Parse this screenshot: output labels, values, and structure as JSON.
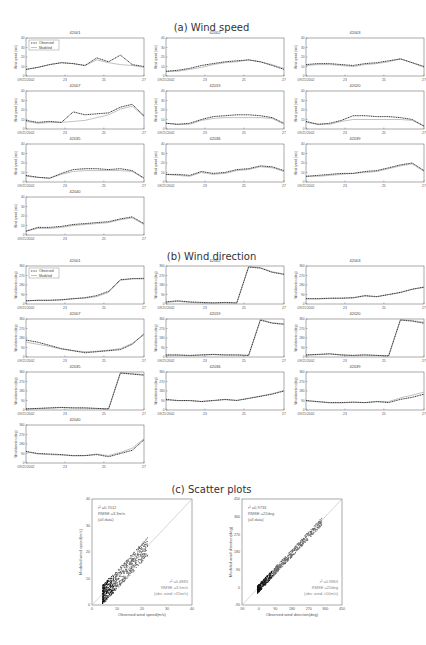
{
  "sections": {
    "a": "(a) Wind speed",
    "b": "(b) Wind direction",
    "c": "(c) Scatter plots"
  },
  "legend": {
    "observed": "Observed",
    "modeled": "Modeled"
  },
  "speed_panels": {
    "ylabel": "Wind speed (m/s)",
    "yticks": [
      "0",
      "10",
      "20",
      "30",
      "40"
    ],
    "xticks": [
      "09/21/2002",
      "23",
      "25",
      "27"
    ],
    "stations": [
      "42001",
      "42002",
      "42003",
      "42007",
      "42019",
      "42020",
      "42035",
      "42036",
      "42039",
      "42040"
    ]
  },
  "direction_panels": {
    "ylabel": "Wind direction (deg)",
    "yticks": [
      "0",
      "90",
      "180",
      "270",
      "360"
    ],
    "xticks": [
      "09/21/2002",
      "23",
      "25",
      "27"
    ],
    "stations": [
      "42001",
      "42002",
      "42003",
      "42007",
      "42019",
      "42020",
      "42035",
      "42036",
      "42039",
      "42040"
    ]
  },
  "scatter_speed": {
    "xlabel": "Observed wind speed(m/s)",
    "ylabel": "Modeled wind speed(m/s)",
    "xticks": [
      "0",
      "10",
      "20",
      "30",
      "40"
    ],
    "yticks": [
      "0",
      "10",
      "20",
      "30",
      "40"
    ],
    "ann1": [
      "r² =0.7012",
      "RMSE =3.3m/s",
      "(all data)"
    ],
    "ann2": [
      "r² =0.4883",
      "RMSE =3.5m/s",
      "(obs. wind >15m/s)"
    ]
  },
  "scatter_dir": {
    "xlabel": "Observed wind direction(deg)",
    "ylabel": "Modeled wind direction(deg)",
    "xticks": [
      "-90",
      "0",
      "90",
      "180",
      "270",
      "360",
      "450"
    ],
    "yticks": [
      "-90",
      "0",
      "90",
      "180",
      "270",
      "360",
      "450"
    ],
    "ann1": [
      "r² =0.9733",
      "RMSE =22deg",
      "(all data)"
    ],
    "ann2": [
      "r² =0.9863",
      "RMSE =22deg",
      "(obs. wind >10m/s)"
    ]
  },
  "chart_data": [
    {
      "type": "line",
      "title": "(a) Wind speed",
      "xlabel": "",
      "ylabel": "Wind speed (m/s)",
      "ylim": [
        0,
        40
      ],
      "x": [
        "09/21/2002",
        "23",
        "25",
        "27"
      ],
      "series_names": [
        "Observed",
        "Modeled"
      ],
      "panels": [
        {
          "station": "42001",
          "observed": [
            7,
            9,
            12,
            14,
            13,
            11,
            19,
            15,
            22,
            12,
            10
          ],
          "modeled": [
            7,
            9,
            12,
            14,
            13,
            11,
            17,
            14,
            12,
            11,
            9
          ]
        },
        {
          "station": "42002",
          "observed": [
            5,
            6,
            8,
            11,
            13,
            15,
            16,
            17,
            15,
            11,
            7
          ],
          "modeled": [
            5,
            5,
            7,
            9,
            12,
            14,
            15,
            17,
            15,
            12,
            8
          ]
        },
        {
          "station": "42003",
          "observed": [
            12,
            13,
            13,
            12,
            11,
            13,
            14,
            16,
            18,
            14,
            10
          ],
          "modeled": [
            11,
            12,
            12,
            11,
            10,
            12,
            13,
            15,
            18,
            14,
            9
          ]
        },
        {
          "station": "42007",
          "observed": [
            9,
            7,
            8,
            7,
            18,
            15,
            16,
            17,
            23,
            26,
            14
          ],
          "modeled": [
            8,
            6,
            7,
            7,
            8,
            9,
            12,
            15,
            21,
            24,
            13
          ]
        },
        {
          "station": "42019",
          "observed": [
            6,
            5,
            6,
            10,
            13,
            14,
            15,
            15,
            14,
            12,
            6
          ],
          "modeled": [
            6,
            5,
            5,
            9,
            11,
            12,
            12,
            12,
            12,
            11,
            5
          ]
        },
        {
          "station": "42020",
          "observed": [
            8,
            5,
            6,
            9,
            14,
            14,
            13,
            13,
            12,
            10,
            3
          ],
          "modeled": [
            7,
            5,
            5,
            8,
            10,
            10,
            10,
            10,
            10,
            9,
            3
          ]
        },
        {
          "station": "42035",
          "observed": [
            7,
            5,
            4,
            9,
            13,
            14,
            14,
            13,
            14,
            12,
            4
          ],
          "modeled": [
            6,
            5,
            4,
            8,
            11,
            12,
            12,
            12,
            12,
            11,
            4
          ]
        },
        {
          "station": "42036",
          "observed": [
            8,
            8,
            7,
            11,
            9,
            10,
            13,
            14,
            17,
            16,
            12
          ],
          "modeled": [
            8,
            7,
            6,
            10,
            8,
            9,
            12,
            13,
            16,
            15,
            11
          ]
        },
        {
          "station": "42039",
          "observed": [
            6,
            7,
            8,
            9,
            9,
            11,
            12,
            15,
            18,
            20,
            12
          ],
          "modeled": [
            6,
            6,
            7,
            8,
            9,
            10,
            11,
            14,
            17,
            19,
            11
          ]
        },
        {
          "station": "42040",
          "observed": [
            4,
            8,
            8,
            9,
            11,
            12,
            13,
            14,
            17,
            19,
            12
          ],
          "modeled": [
            4,
            7,
            7,
            8,
            10,
            11,
            12,
            13,
            16,
            18,
            11
          ]
        }
      ]
    },
    {
      "type": "line",
      "title": "(b) Wind direction",
      "xlabel": "",
      "ylabel": "Wind direction (deg)",
      "ylim": [
        0,
        360
      ],
      "x": [
        "09/21/2002",
        "23",
        "25",
        "27"
      ],
      "series_names": [
        "Observed",
        "Modeled"
      ],
      "panels": [
        {
          "station": "42001",
          "observed": [
            30,
            35,
            35,
            40,
            50,
            60,
            80,
            120,
            230,
            240,
            240
          ],
          "modeled": [
            30,
            35,
            35,
            40,
            50,
            55,
            70,
            110,
            225,
            240,
            245
          ]
        },
        {
          "station": "42002",
          "observed": [
            20,
            30,
            20,
            15,
            10,
            15,
            10,
            350,
            340,
            300,
            280
          ],
          "modeled": [
            15,
            25,
            15,
            10,
            10,
            10,
            10,
            355,
            345,
            305,
            285
          ]
        },
        {
          "station": "42003",
          "observed": [
            50,
            50,
            55,
            55,
            60,
            80,
            70,
            90,
            110,
            140,
            160
          ],
          "modeled": [
            50,
            48,
            52,
            55,
            58,
            75,
            68,
            88,
            108,
            138,
            158
          ]
        },
        {
          "station": "42007",
          "observed": [
            160,
            140,
            110,
            80,
            60,
            40,
            50,
            60,
            70,
            120,
            220
          ],
          "modeled": [
            140,
            120,
            100,
            75,
            60,
            50,
            55,
            65,
            80,
            130,
            210
          ]
        },
        {
          "station": "42019",
          "observed": [
            20,
            20,
            15,
            20,
            25,
            20,
            20,
            15,
            350,
            320,
            310
          ],
          "modeled": [
            15,
            15,
            12,
            18,
            22,
            18,
            18,
            14,
            355,
            325,
            315
          ]
        },
        {
          "station": "42020",
          "observed": [
            20,
            25,
            30,
            20,
            15,
            20,
            15,
            10,
            350,
            340,
            320
          ],
          "modeled": [
            15,
            22,
            28,
            18,
            14,
            18,
            14,
            10,
            355,
            345,
            330
          ]
        },
        {
          "station": "42035",
          "observed": [
            10,
            15,
            20,
            25,
            20,
            20,
            15,
            10,
            350,
            340,
            330
          ],
          "modeled": [
            10,
            12,
            18,
            22,
            20,
            18,
            14,
            10,
            355,
            345,
            335
          ]
        },
        {
          "station": "42036",
          "observed": [
            100,
            90,
            90,
            80,
            90,
            100,
            90,
            110,
            130,
            150,
            180
          ],
          "modeled": [
            95,
            88,
            88,
            82,
            88,
            98,
            92,
            110,
            132,
            155,
            185
          ]
        },
        {
          "station": "42039",
          "observed": [
            90,
            80,
            70,
            70,
            75,
            70,
            80,
            70,
            100,
            120,
            150
          ],
          "modeled": [
            85,
            78,
            68,
            68,
            72,
            70,
            80,
            80,
            115,
            140,
            170
          ]
        },
        {
          "station": "42040",
          "observed": [
            110,
            90,
            85,
            80,
            70,
            70,
            80,
            60,
            90,
            120,
            220
          ],
          "modeled": [
            105,
            85,
            80,
            75,
            68,
            70,
            85,
            70,
            100,
            140,
            230
          ]
        }
      ]
    },
    {
      "type": "scatter",
      "title": "Wind speed scatter",
      "xlabel": "Observed wind speed(m/s)",
      "ylabel": "Modeled wind speed(m/s)",
      "xlim": [
        0,
        40
      ],
      "ylim": [
        0,
        40
      ],
      "annotations": [
        "r²=0.7012, RMSE=3.3m/s (all data)",
        "r²=0.4883, RMSE=3.5m/s (obs. wind >15m/s)"
      ]
    },
    {
      "type": "scatter",
      "title": "Wind direction scatter",
      "xlabel": "Observed wind direction(deg)",
      "ylabel": "Modeled wind direction(deg)",
      "xlim": [
        -90,
        450
      ],
      "ylim": [
        -90,
        450
      ],
      "annotations": [
        "r²=0.9733, RMSE=22deg (all data)",
        "r²=0.9863, RMSE=22deg (obs. wind >10m/s)"
      ]
    }
  ]
}
